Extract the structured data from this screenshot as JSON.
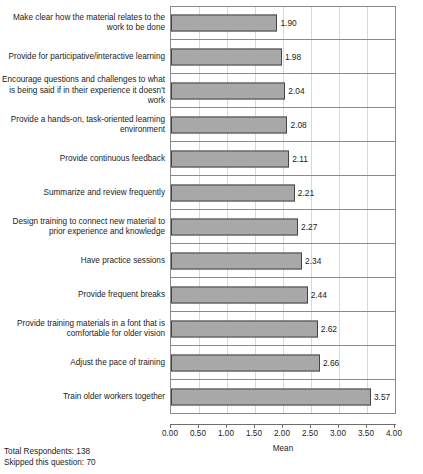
{
  "chart_data": {
    "type": "bar",
    "orientation": "horizontal",
    "title": "",
    "xlabel": "Mean",
    "ylabel": "",
    "xlim": [
      0,
      4
    ],
    "grid": true,
    "legend": null,
    "tick_labels": [
      "0.00",
      "0.50",
      "1.00",
      "1.50",
      "2.00",
      "2.50",
      "3.00",
      "3.50",
      "4.00"
    ],
    "tick_values": [
      0,
      0.5,
      1,
      1.5,
      2,
      2.5,
      3,
      3.5,
      4
    ],
    "categories": [
      "Make clear how the material relates to the work to be done",
      "Provide for participative/interactive learning",
      "Encourage questions and challenges to what is being said if in their experience it doesn't work",
      "Provide a hands-on, task-oriented learning environment",
      "Provide continuous feedback",
      "Summarize and review frequently",
      "Design training to connect new material to prior experience and knowledge",
      "Have practice sessions",
      "Provide frequent breaks",
      "Provide training materials in a font that is comfortable for older vision",
      "Adjust the pace of training",
      "Train older workers together"
    ],
    "values": [
      1.9,
      1.98,
      2.04,
      2.08,
      2.11,
      2.21,
      2.27,
      2.34,
      2.44,
      2.62,
      2.66,
      3.57
    ],
    "value_labels": [
      "1.90",
      "1.98",
      "2.04",
      "2.08",
      "2.11",
      "2.21",
      "2.27",
      "2.34",
      "2.44",
      "2.62",
      "2.66",
      "3.57"
    ],
    "colors": {
      "bar_fill": "#a8a8a8",
      "bar_border": "#454545",
      "axis": "#6e6e6e",
      "grid": "#d8d8d8",
      "text": "#1c1c1c"
    }
  },
  "footer": {
    "total_respondents": "Total Respondents: 138",
    "skipped": "Skipped this question: 70"
  }
}
